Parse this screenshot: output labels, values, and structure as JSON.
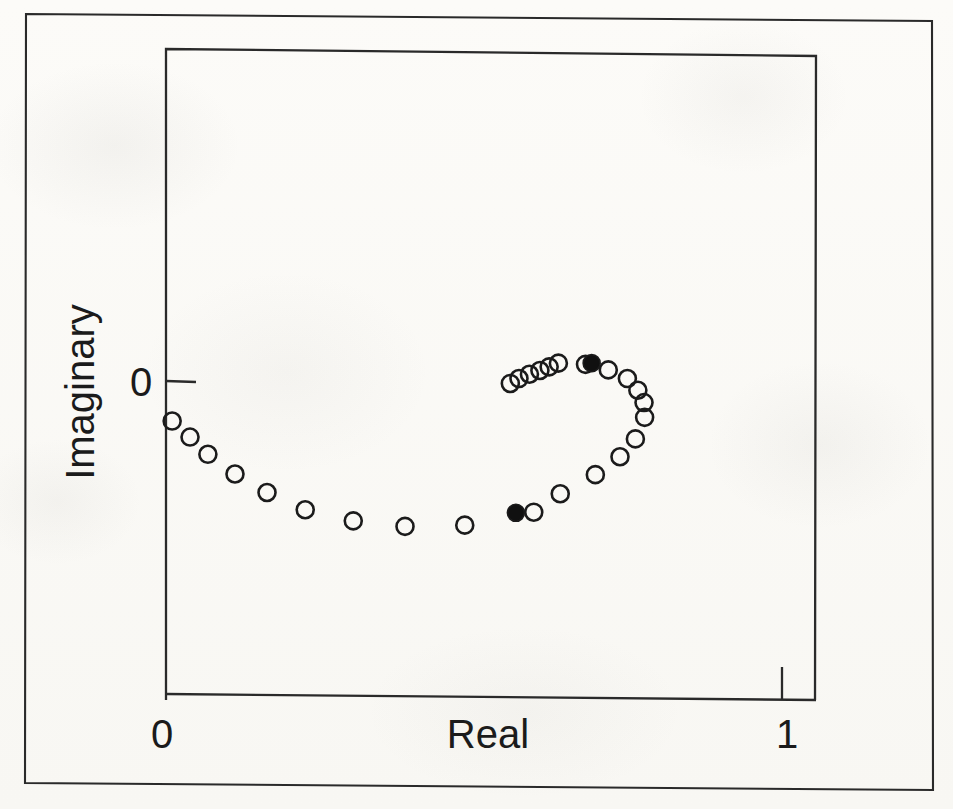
{
  "figure": {
    "kind": "scatter-plot",
    "paper_color": "#fbfaf7",
    "ink_color": "#1b1b1b"
  },
  "axes": {
    "x_label": "Real",
    "y_label": "Imaginary",
    "x_ticks": [
      {
        "label": "0",
        "value": 0
      },
      {
        "label": "1",
        "value": 1
      }
    ],
    "y_ticks": [
      {
        "label": "0",
        "value": 0
      }
    ]
  },
  "chart_data": {
    "type": "scatter",
    "title": "",
    "xlabel": "Real",
    "ylabel": "Imaginary",
    "xlim": [
      0,
      1
    ],
    "ylim": [
      -0.52,
      0.1
    ],
    "grid": false,
    "legend": "none",
    "xticks": [
      0,
      1
    ],
    "xticklabels": [
      "0",
      "1"
    ],
    "yticks": [
      0
    ],
    "yticklabels": [
      "0"
    ],
    "series": [
      {
        "name": "open-markers",
        "marker": "open-circle",
        "marker_size_px": 17,
        "color": "#1b1b1b",
        "fill": "none",
        "points": [
          {
            "x": 0.01,
            "y": -0.065
          },
          {
            "x": 0.039,
            "y": -0.091
          },
          {
            "x": 0.068,
            "y": -0.119
          },
          {
            "x": 0.112,
            "y": -0.151
          },
          {
            "x": 0.164,
            "y": -0.181
          },
          {
            "x": 0.226,
            "y": -0.209
          },
          {
            "x": 0.304,
            "y": -0.227
          },
          {
            "x": 0.388,
            "y": -0.236
          },
          {
            "x": 0.485,
            "y": -0.234
          },
          {
            "x": 0.597,
            "y": -0.213
          },
          {
            "x": 0.64,
            "y": -0.183
          },
          {
            "x": 0.697,
            "y": -0.152
          },
          {
            "x": 0.737,
            "y": -0.123
          },
          {
            "x": 0.762,
            "y": -0.094
          },
          {
            "x": 0.777,
            "y": -0.059
          },
          {
            "x": 0.776,
            "y": -0.035
          },
          {
            "x": 0.766,
            "y": -0.015
          },
          {
            "x": 0.749,
            "y": 0.004
          },
          {
            "x": 0.718,
            "y": 0.018
          },
          {
            "x": 0.681,
            "y": 0.027
          },
          {
            "x": 0.637,
            "y": 0.029
          },
          {
            "x": 0.622,
            "y": 0.023
          },
          {
            "x": 0.607,
            "y": 0.017
          },
          {
            "x": 0.59,
            "y": 0.011
          },
          {
            "x": 0.573,
            "y": 0.004
          },
          {
            "x": 0.559,
            "y": -0.004
          }
        ]
      },
      {
        "name": "filled-markers",
        "marker": "filled-circle",
        "marker_size_px": 17,
        "color": "#1b1b1b",
        "fill": "#101010",
        "points": [
          {
            "x": 0.568,
            "y": -0.214
          },
          {
            "x": 0.691,
            "y": 0.029
          }
        ]
      }
    ]
  }
}
